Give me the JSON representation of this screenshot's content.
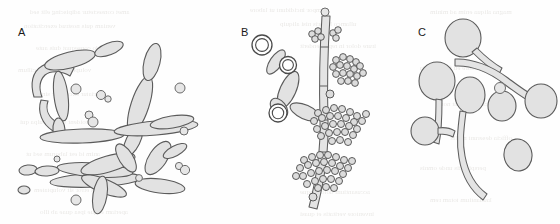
{
  "figure": {
    "width": 560,
    "height": 224,
    "background_color": "#fefefe",
    "panels": [
      {
        "id": "A",
        "label": "A",
        "label_x": 18,
        "label_y": 27,
        "description": "pseudohyphae and elongated hyphal elements with scattered budding yeast cells",
        "structures": [
          "pseudohypha",
          "elongate-cell",
          "budding-yeast",
          "blastospore"
        ]
      },
      {
        "id": "B",
        "label": "B",
        "label_x": 241,
        "label_y": 27,
        "description": "branched hypha bearing thick-walled double-ringed chlamydospores and dense grape-like clusters of blastoconidia",
        "structures": [
          "hypha",
          "chlamydospore-ring",
          "blastoconidia-cluster",
          "branch"
        ]
      },
      {
        "id": "C",
        "label": "C",
        "label_x": 418,
        "label_y": 27,
        "description": "round yeast cells producing elongate germ tubes, plus single budding cells",
        "structures": [
          "round-yeast",
          "germ-tube",
          "budding-cell"
        ]
      }
    ],
    "style": {
      "cell_fill": "#e2e2e2",
      "cell_stroke": "#5b5b5b",
      "conidium_fill": "#dcdcdc",
      "conidium_stroke": "#4a4a4a",
      "ring_fill": "#ffffff",
      "ring_stroke": "#4a4a4a",
      "label_color": "#1a1a1a",
      "ghost_text_color": "#7d7366"
    }
  },
  "ghost_text": {
    "note": "faint mirrored show-through text from the reverse of the scanned page; not legible content",
    "lines": [
      {
        "x": 30,
        "y": 8,
        "size": 7,
        "text": "amet consectetur adipiscing elit sed"
      },
      {
        "x": 250,
        "y": 6,
        "size": 7,
        "text": "tempor incididunt ut labore"
      },
      {
        "x": 430,
        "y": 8,
        "size": 7,
        "text": "magna aliqua enim ad minim"
      },
      {
        "x": 24,
        "y": 22,
        "size": 7,
        "text": "veniam quis nostrud exercitation"
      },
      {
        "x": 280,
        "y": 20,
        "size": 7,
        "text": "ullamco laboris nisi aliquip"
      },
      {
        "x": 36,
        "y": 44,
        "size": 7,
        "text": "commodo consequat duis aute"
      },
      {
        "x": 300,
        "y": 42,
        "size": 7,
        "text": "irure dolor in reprehenderit"
      },
      {
        "x": 18,
        "y": 66,
        "size": 7,
        "text": "voluptate velit esse cillum"
      },
      {
        "x": 420,
        "y": 64,
        "size": 7,
        "text": "dolore eu fugiat nulla"
      },
      {
        "x": 40,
        "y": 90,
        "size": 7,
        "text": "pariatur excepteur sint"
      },
      {
        "x": 440,
        "y": 100,
        "size": 7,
        "text": "occaecat cupidatat non"
      },
      {
        "x": 20,
        "y": 118,
        "size": 7,
        "text": "proident sunt in culpa qui"
      },
      {
        "x": 450,
        "y": 134,
        "size": 7,
        "text": "officia deserunt mollit"
      },
      {
        "x": 26,
        "y": 150,
        "size": 7,
        "text": "anim id est laborum sed ut"
      },
      {
        "x": 420,
        "y": 164,
        "size": 7,
        "text": "perspiciatis unde omnis"
      },
      {
        "x": 34,
        "y": 186,
        "size": 7,
        "text": "iste natus error sit voluptatem"
      },
      {
        "x": 300,
        "y": 188,
        "size": 7,
        "text": "accusantium doloremque"
      },
      {
        "x": 430,
        "y": 196,
        "size": 7,
        "text": "laudantium totam rem"
      },
      {
        "x": 40,
        "y": 208,
        "size": 7,
        "text": "aperiam eaque ipsa quae ab illo"
      },
      {
        "x": 300,
        "y": 210,
        "size": 7,
        "text": "inventore veritatis et quasi"
      }
    ]
  }
}
